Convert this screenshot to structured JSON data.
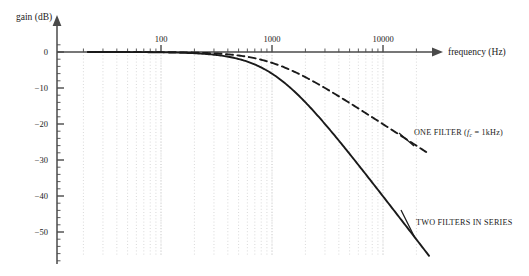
{
  "chart_data": {
    "type": "line",
    "title": "",
    "xlabel": "frequency (Hz)",
    "ylabel": "gain (dB)",
    "xscale": "log",
    "xlim": [
      20,
      30000
    ],
    "ylim": [
      -55,
      2
    ],
    "grid": true,
    "grid_style": "dotted vertical log minor gridlines",
    "xticks_major": [
      100,
      1000,
      10000
    ],
    "xtick_labels": [
      "100",
      "1000",
      "10000"
    ],
    "yticks_major": [
      0,
      -10,
      -20,
      -30,
      -40,
      -50
    ],
    "ytick_labels": [
      "0",
      "−10",
      "−20",
      "−30",
      "−40",
      "−50"
    ],
    "legend_position": "inline annotations at right of curves",
    "series": [
      {
        "name": "ONE FILTER",
        "style": "dashed",
        "color": "#1a1a1a",
        "fc_hz": 1000,
        "order": 1,
        "x": [
          20,
          50,
          100,
          200,
          300,
          500,
          700,
          1000,
          1500,
          2000,
          3000,
          5000,
          7000,
          10000,
          15000,
          20000,
          25000
        ],
        "y": [
          0.0,
          0.0,
          -0.04,
          -0.17,
          -0.37,
          -0.97,
          -1.7,
          -3.01,
          -5.1,
          -7.0,
          -10.0,
          -14.2,
          -17.0,
          -20.0,
          -23.5,
          -26.0,
          -28.0
        ]
      },
      {
        "name": "TWO FILTERS IN SERIES",
        "style": "solid",
        "color": "#1a1a1a",
        "fc_hz": 1000,
        "order": 2,
        "x": [
          20,
          50,
          100,
          200,
          300,
          500,
          700,
          1000,
          1500,
          2000,
          3000,
          5000,
          7000,
          10000,
          15000,
          20000,
          25000
        ],
        "y": [
          0.0,
          0.0,
          -0.09,
          -0.34,
          -0.75,
          -1.94,
          -3.4,
          -6.02,
          -10.2,
          -14.0,
          -20.0,
          -28.3,
          -34.0,
          -40.0,
          -47.0,
          -52.0,
          -56.0
        ]
      }
    ],
    "annotations": [
      {
        "id": "one-filter-annotation",
        "text_before": "ONE FILTER  (",
        "text_italic": "f",
        "text_sub": "c",
        "text_after": " = 1kHz)",
        "full_text": "ONE FILTER  (f_c = 1kHz)",
        "leader": true
      },
      {
        "id": "two-filters-annotation",
        "text": "TWO FILTERS IN SERIES",
        "leader": true
      }
    ]
  },
  "axes": {
    "gain_axis_label": "gain (dB)",
    "frequency_axis_label": "frequency (Hz)",
    "x_tick_100": "100",
    "x_tick_1000": "1000",
    "x_tick_10000": "10000",
    "y_tick_0": "0",
    "y_tick_m10": "−10",
    "y_tick_m20": "−20",
    "y_tick_m30": "−30",
    "y_tick_m40": "−40",
    "y_tick_m50": "−50"
  },
  "labels": {
    "one_filter_prefix": "ONE FILTER  (",
    "one_filter_f": "f",
    "one_filter_sub": "c",
    "one_filter_suffix": " = 1kHz)",
    "two_filters": "TWO FILTERS IN SERIES"
  },
  "colors": {
    "axis": "#4a4a4a",
    "curve": "#1a1a1a",
    "grid": "#cfcfcf",
    "text": "#1a1a1a",
    "background": "#ffffff"
  }
}
